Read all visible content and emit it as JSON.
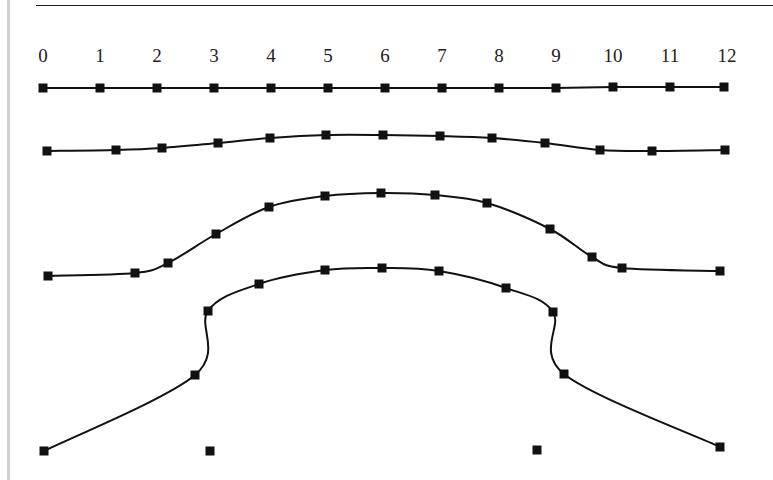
{
  "diagram": {
    "axis_labels": [
      "0",
      "1",
      "2",
      "3",
      "4",
      "5",
      "6",
      "7",
      "8",
      "9",
      "10",
      "11",
      "12"
    ],
    "axis_label_x": [
      43,
      100,
      157,
      214,
      271,
      328,
      385,
      442,
      499,
      556,
      613,
      670,
      727
    ],
    "axis_label_y": 62,
    "marker_size": 9,
    "line_color": "#111111",
    "curves": [
      {
        "name": "curve-1-flat",
        "points": [
          [
            43,
            88
          ],
          [
            100,
            88
          ],
          [
            157,
            88
          ],
          [
            214,
            88
          ],
          [
            271,
            88
          ],
          [
            328,
            88
          ],
          [
            385,
            88
          ],
          [
            442,
            88
          ],
          [
            499,
            88
          ],
          [
            556,
            88
          ],
          [
            613,
            87
          ],
          [
            670,
            87
          ],
          [
            724,
            87
          ]
        ]
      },
      {
        "name": "curve-2-slight-bump",
        "points": [
          [
            47,
            151
          ],
          [
            116,
            150
          ],
          [
            162,
            148
          ],
          [
            218,
            143
          ],
          [
            270,
            138
          ],
          [
            326,
            135
          ],
          [
            383,
            135
          ],
          [
            440,
            136
          ],
          [
            492,
            138
          ],
          [
            545,
            143
          ],
          [
            600,
            150
          ],
          [
            652,
            151
          ],
          [
            725,
            150
          ]
        ]
      },
      {
        "name": "curve-3-medium-bump",
        "points": [
          [
            48,
            276
          ],
          [
            135,
            273
          ],
          [
            168,
            263
          ],
          [
            216,
            234
          ],
          [
            269,
            207
          ],
          [
            325,
            196
          ],
          [
            381,
            193
          ],
          [
            435,
            195
          ],
          [
            487,
            203
          ],
          [
            550,
            229
          ],
          [
            592,
            257
          ],
          [
            622,
            268
          ],
          [
            720,
            271
          ]
        ]
      },
      {
        "name": "curve-4-steep-bump",
        "points": [
          [
            44,
            451
          ],
          [
            195,
            375
          ],
          [
            208,
            311
          ],
          [
            259,
            284
          ],
          [
            325,
            270
          ],
          [
            382,
            268
          ],
          [
            439,
            271
          ],
          [
            506,
            288
          ],
          [
            553,
            312
          ],
          [
            564,
            374
          ],
          [
            720,
            447
          ]
        ]
      }
    ],
    "isolated_points": [
      [
        210,
        451
      ],
      [
        537,
        450
      ]
    ]
  }
}
